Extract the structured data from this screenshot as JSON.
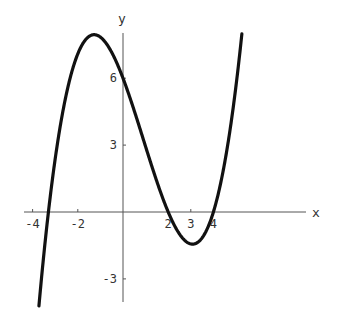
{
  "chart_data": {
    "type": "line",
    "title": "",
    "xlabel": "x",
    "ylabel": "y",
    "xlim": [
      -4.1,
      8.2
    ],
    "ylim": [
      -3.9,
      8.1
    ],
    "grid": false,
    "legend": null,
    "x_ticks": [
      -4,
      -2,
      2,
      3,
      4
    ],
    "x_tick_labels": [
      "-4",
      "-2",
      "2",
      "3",
      "4"
    ],
    "y_ticks": [
      -3,
      3,
      6
    ],
    "y_tick_labels": [
      "-3",
      "3",
      "6"
    ],
    "series": [
      {
        "name": "f(x)",
        "description": "cubic with roots near x=-3.3, 2, 4; local max ~7.9 near x=-1.3; local min ~-1.4 near x=3.1; y-intercept 6",
        "x": [
          -3.7,
          -3.5,
          -3.3,
          -3.0,
          -2.5,
          -2.0,
          -1.5,
          -1.0,
          -0.5,
          0.0,
          0.5,
          1.0,
          1.5,
          2.0,
          2.5,
          3.0,
          3.5,
          4.0,
          4.5,
          5.0,
          5.3
        ],
        "y": [
          -3.8,
          -1.8,
          0.0,
          1.76,
          4.03,
          5.68,
          7.13,
          7.83,
          7.44,
          6.0,
          4.95,
          3.51,
          1.91,
          0.0,
          -0.94,
          -1.43,
          -1.39,
          0.0,
          1.22,
          3.61,
          7.9
        ]
      }
    ],
    "color": "#111111"
  },
  "axes": {
    "x_label": "x",
    "y_label": "y"
  }
}
